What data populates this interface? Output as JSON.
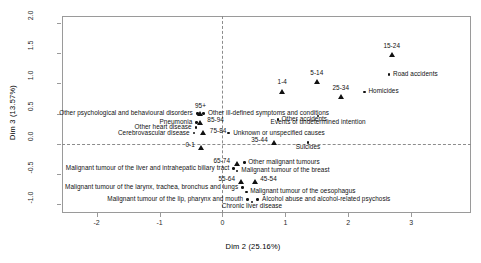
{
  "chart_data": {
    "type": "scatter",
    "title": "",
    "xlabel": "Dim 2 (25.16%)",
    "ylabel": "Dim 3 (13.57%)",
    "xlim": [
      -2.55,
      3.95
    ],
    "ylim": [
      -1.15,
      2.12
    ],
    "xticks": [
      -2,
      -1,
      0,
      1,
      2,
      3
    ],
    "xticklabels": [
      "-2",
      "-1",
      "0",
      "1",
      "2",
      "3"
    ],
    "yticks": [
      -1.0,
      -0.5,
      0.0,
      0.5,
      1.0,
      1.5,
      2.0
    ],
    "yticklabels": [
      "-1.0",
      "-0.5",
      "0.0",
      "0.5",
      "1.0",
      "1.5",
      "2.0"
    ],
    "grid": false,
    "reference_lines": {
      "vertical_x": 0,
      "horizontal_y": 0,
      "style": "dashed"
    },
    "legend": "none",
    "series": [
      {
        "name": "Age groups",
        "marker": "triangle",
        "color": "#111111",
        "points": [
          {
            "label": "95+",
            "x": -0.35,
            "y": 0.5,
            "lx": -0.35,
            "ly": 0.62,
            "align": "c"
          },
          {
            "label": "85-94",
            "x": -0.35,
            "y": 0.355,
            "lx": -0.24,
            "ly": 0.385,
            "align": "l"
          },
          {
            "label": "75-84",
            "x": -0.31,
            "y": 0.175,
            "lx": -0.2,
            "ly": 0.205,
            "align": "l"
          },
          {
            "label": "65-74",
            "x": 0.23,
            "y": -0.33,
            "lx": 0.12,
            "ly": -0.3,
            "align": "r"
          },
          {
            "label": "55-64",
            "x": 0.3,
            "y": -0.63,
            "lx": 0.2,
            "ly": -0.6,
            "align": "r"
          },
          {
            "label": "45-54",
            "x": 0.52,
            "y": -0.63,
            "lx": 0.6,
            "ly": -0.6,
            "align": "l"
          },
          {
            "label": "35-44",
            "x": 0.83,
            "y": 0.02,
            "lx": 0.72,
            "ly": 0.055,
            "align": "r"
          },
          {
            "label": "25-34",
            "x": 1.88,
            "y": 0.78,
            "lx": 1.88,
            "ly": 0.92,
            "align": "c"
          },
          {
            "label": "15-24",
            "x": 2.69,
            "y": 1.48,
            "lx": 2.69,
            "ly": 1.62,
            "align": "c"
          },
          {
            "label": "5-14",
            "x": 1.5,
            "y": 1.03,
            "lx": 1.5,
            "ly": 1.17,
            "align": "c"
          },
          {
            "label": "1-4",
            "x": 0.95,
            "y": 0.87,
            "lx": 0.95,
            "ly": 1.01,
            "align": "c"
          },
          {
            "label": "0-1",
            "x": -0.33,
            "y": -0.06,
            "lx": -0.44,
            "ly": -0.03,
            "align": "r"
          }
        ]
      },
      {
        "name": "Causes of death",
        "marker": "dot",
        "color": "#111111",
        "points": [
          {
            "label": "Other psychological and behavioural disorders",
            "x": -0.4,
            "y": 0.5,
            "lx": -0.47,
            "ly": 0.5,
            "align": "r"
          },
          {
            "label": "Pneumonia",
            "x": -0.41,
            "y": 0.355,
            "lx": -0.48,
            "ly": 0.355,
            "align": "r"
          },
          {
            "label": "Other heart disease",
            "x": -0.42,
            "y": 0.265,
            "lx": -0.49,
            "ly": 0.265,
            "align": "r"
          },
          {
            "label": "Cerebrovascular disease",
            "x": -0.45,
            "y": 0.175,
            "lx": -0.52,
            "ly": 0.175,
            "align": "r"
          },
          {
            "label": "Other ill-defined symptoms and conditions",
            "x": -0.3,
            "y": 0.5,
            "lx": -0.23,
            "ly": 0.5,
            "align": "l"
          },
          {
            "label": "Other accidents",
            "x": 0.88,
            "y": 0.405,
            "lx": 0.94,
            "ly": 0.405,
            "align": "l"
          },
          {
            "label": "Unknown or unspecified causes",
            "x": 0.1,
            "y": 0.175,
            "lx": 0.17,
            "ly": 0.175,
            "align": "l"
          },
          {
            "label": "Events of undetermined intention",
            "x": 1.52,
            "y": 0.46,
            "lx": 1.52,
            "ly": 0.355,
            "align": "c"
          },
          {
            "label": "Suicides",
            "x": 1.36,
            "y": 0.02,
            "lx": 1.36,
            "ly": -0.07,
            "align": "c"
          },
          {
            "label": "Homicides",
            "x": 2.26,
            "y": 0.86,
            "lx": 2.32,
            "ly": 0.86,
            "align": "l"
          },
          {
            "label": "Road accidents",
            "x": 2.65,
            "y": 1.15,
            "lx": 2.71,
            "ly": 1.15,
            "align": "l"
          },
          {
            "label": "Other malignant tumours",
            "x": 0.35,
            "y": -0.31,
            "lx": 0.41,
            "ly": -0.31,
            "align": "l"
          },
          {
            "label": "Malignant tumour of the breast",
            "x": 0.23,
            "y": -0.45,
            "lx": 0.3,
            "ly": -0.45,
            "align": "l"
          },
          {
            "label": "Malignant tumour of the liver and intrahepatic biliary tract",
            "x": 0.18,
            "y": -0.41,
            "lx": 0.11,
            "ly": -0.41,
            "align": "r"
          },
          {
            "label": "Malignant tumour of the oesophagus",
            "x": 0.38,
            "y": -0.8,
            "lx": 0.44,
            "ly": -0.8,
            "align": "l"
          },
          {
            "label": "Malignant tumour of the larynx, trachea, bronchus and lungs",
            "x": 0.32,
            "y": -0.73,
            "lx": 0.25,
            "ly": -0.73,
            "align": "r"
          },
          {
            "label": "Malignant tumour of the lip, pharynx and mouth",
            "x": 0.4,
            "y": -0.93,
            "lx": 0.33,
            "ly": -0.93,
            "align": "r"
          },
          {
            "label": "Alcohol abuse and alcohol-related psychosis",
            "x": 0.56,
            "y": -0.93,
            "lx": 0.63,
            "ly": -0.93,
            "align": "l"
          },
          {
            "label": "Chronic liver disease",
            "x": 0.47,
            "y": -0.97,
            "lx": 0.47,
            "ly": -1.05,
            "align": "c"
          }
        ]
      }
    ]
  }
}
